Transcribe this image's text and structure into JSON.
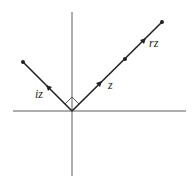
{
  "diagram": {
    "labels": {
      "iz": "iz",
      "z": "z",
      "rz": "rz"
    },
    "colors": {
      "line": "#222222",
      "background": "#ffffff"
    }
  }
}
